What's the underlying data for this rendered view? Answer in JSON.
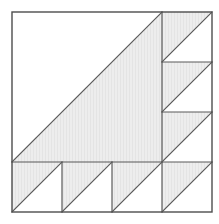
{
  "figure": {
    "canvas": {
      "width": 219,
      "height": 224
    },
    "colors": {
      "background": "#ffffff",
      "shade_fill": "#ededed",
      "hatch_line": "#e2e2e2",
      "unshaded_fill": "#ffffff",
      "stroke": "#595959",
      "outer_stroke": "#4d4d4d"
    },
    "stroke_width": 1.2,
    "square": {
      "label": "outer-square",
      "x": 12,
      "y": 12,
      "width": 200,
      "height": 200
    },
    "grid": {
      "cell_size": 50,
      "column_divider_x": 162,
      "row_divider_y": 162,
      "right_column_line_ys": [
        62,
        112,
        162
      ],
      "bottom_row_line_xs": [
        62,
        112,
        162
      ]
    },
    "main_triangle": {
      "label": "large-shaded-triangle",
      "points": "12,162 162,12 162,162",
      "shaded": true,
      "leg_length": 150
    },
    "right_column_cells": [
      {
        "label": "right-cell-1",
        "x": 162,
        "y": 12,
        "size": 50,
        "triangle": "162,62 162,12 212,12",
        "shaded": true
      },
      {
        "label": "right-cell-2",
        "x": 162,
        "y": 62,
        "size": 50,
        "triangle": "162,112 162,62 212,62",
        "shaded": true
      },
      {
        "label": "right-cell-3",
        "x": 162,
        "y": 112,
        "size": 50,
        "triangle": "162,162 162,112 212,112",
        "shaded": true
      },
      {
        "label": "right-cell-4",
        "x": 162,
        "y": 162,
        "size": 50,
        "triangle": "162,212 162,162 212,162",
        "shaded": true
      }
    ],
    "bottom_row_cells": [
      {
        "label": "bottom-cell-1",
        "x": 12,
        "y": 162,
        "size": 50,
        "triangle": "12,212 12,162 62,162",
        "shaded": true
      },
      {
        "label": "bottom-cell-2",
        "x": 62,
        "y": 162,
        "size": 50,
        "triangle": "62,212 62,162 112,162",
        "shaded": true
      },
      {
        "label": "bottom-cell-3",
        "x": 112,
        "y": 162,
        "size": 50,
        "triangle": "112,212 112,162 162,162",
        "shaded": true
      },
      {
        "label": "bottom-cell-4",
        "x": 162,
        "y": 162,
        "size": 50,
        "triangle": "162,212 162,162 212,162",
        "shaded": true
      }
    ]
  }
}
